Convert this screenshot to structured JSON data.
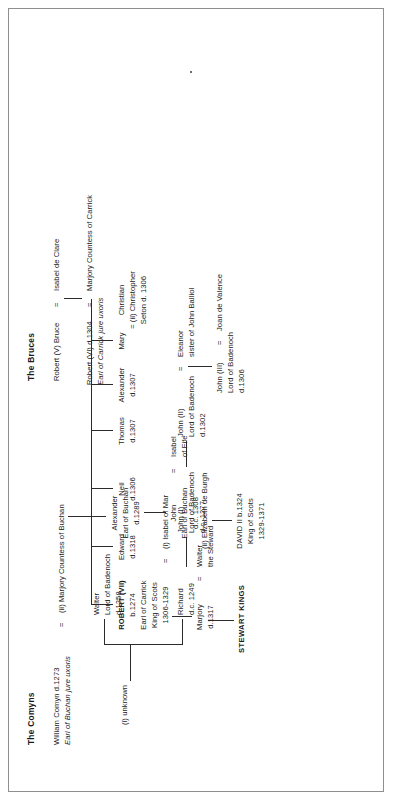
{
  "document": {
    "title": "The Comyns and The Bruces genealogical table",
    "page_background": "#ffffff",
    "ink_color": "#1a1a1a",
    "rule_color": "#2b2b2b"
  },
  "comyns": {
    "heading": "The Comyns",
    "patriarch": {
      "name": "William Comyn d.1273",
      "style": "Earl of Buchan jure uxoris",
      "marriage_sign": "="
    },
    "wives": [
      {
        "label": "(i) unknown"
      },
      {
        "label": "(ii) Marjory Countess of Buchan"
      }
    ],
    "buchan_line": [
      {
        "name": "Alexander",
        "style": "Earl of Buchan",
        "death": "d.1289"
      },
      {
        "name": "John",
        "style": "Earl of Buchan",
        "death": "d.c. 1308",
        "marriage_sign": "=",
        "spouse_name": "Isabel",
        "spouse_style": "of Fife"
      }
    ],
    "badenoch_line": [
      {
        "name": "Walter",
        "style": "Lord of Badenoch",
        "death": "d.1258"
      },
      {
        "name": "Richard",
        "death": "d.c. 1249"
      },
      {
        "name": "John (I)",
        "style": "Lord of Badenoch",
        "death": "d.c. 1277"
      },
      {
        "name": "John (II)",
        "style": "Lord of Badenoch",
        "death": "d.1302",
        "marriage_sign": "=",
        "spouse_name": "Eleanor",
        "spouse_style": "sister of John Balliol"
      },
      {
        "name": "John (III)",
        "style": "Lord of Badenoch",
        "death": "d.1306",
        "marriage_sign": "=",
        "spouse_name": "Joan de Valence"
      }
    ]
  },
  "bruces": {
    "heading": "The Bruces",
    "generation_1": {
      "name": "Robert (V) Bruce",
      "marriage_sign": "=",
      "spouse": "Isabel de Clare"
    },
    "generation_2": {
      "name": "Robert (VI) d.1304",
      "style": "Earl of Carrick jure uxoris",
      "marriage_sign": "=",
      "spouse": "Marjory Countess of Carrick"
    },
    "children": [
      {
        "name": "ROBERT (VII)",
        "born": "b.1274",
        "style": "Earl of Carrick",
        "title": "King of Scots",
        "reign": "1306-1329",
        "marriage_sign": "="
      },
      {
        "name": "Edward",
        "death": "d.1318"
      },
      {
        "name": "Neil",
        "death": "d.1306"
      },
      {
        "name": "Thomas",
        "death": "d.1307"
      },
      {
        "name": "Alexander",
        "death": "d.1307"
      },
      {
        "name": "Mary"
      },
      {
        "name": "Christian",
        "marriage_note": "= (ii) Christopher",
        "marriage_note2": "Seton d. 1306"
      }
    ],
    "robert_vii_wives": [
      {
        "label": "(i) Isabel of Mar"
      },
      {
        "label": "(ii) Elizabeth de Burgh"
      }
    ],
    "robert_vii_issue": [
      {
        "name": "Marjory",
        "death": "d.1317",
        "marriage_sign": "=",
        "spouse_name": "Walter",
        "spouse_style": "the Steward",
        "descendants": "STEWART KINGS"
      },
      {
        "name": "DAVID II b.1324",
        "title": "King of Scots",
        "reign": "1329-1371"
      }
    ]
  }
}
